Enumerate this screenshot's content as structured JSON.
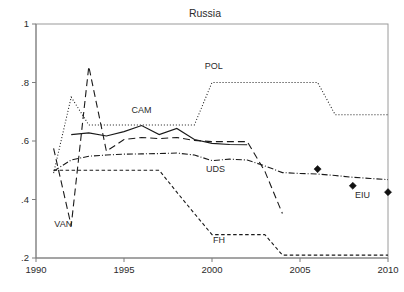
{
  "chart_data": {
    "type": "line",
    "title": "Russia",
    "xlabel": "",
    "ylabel": "",
    "xlim": [
      1990,
      2010
    ],
    "ylim": [
      0.2,
      1.0
    ],
    "grid": false,
    "legend": "inline-labels",
    "xticks": [
      1990,
      1995,
      2000,
      2005,
      2010
    ],
    "xtick_labels": [
      "1990",
      "1995",
      "2000",
      "2005",
      "2010"
    ],
    "yticks": [
      0.2,
      0.4,
      0.6,
      0.8,
      1.0
    ],
    "ytick_labels": [
      ".2",
      ".4",
      ".6",
      ".8",
      "1"
    ],
    "series": [
      {
        "name": "POL",
        "label": "POL",
        "style": "dotted",
        "label_x": 2000.1,
        "label_y": 0.845,
        "x": [
          1991,
          1992,
          1993,
          1994,
          1995,
          1996,
          1997,
          1998,
          1999,
          2000,
          2001,
          2002,
          2003,
          2004,
          2005,
          2006,
          2007,
          2008,
          2009,
          2010
        ],
        "y": [
          0.49,
          0.75,
          0.655,
          0.655,
          0.655,
          0.655,
          0.655,
          0.655,
          0.655,
          0.8,
          0.8,
          0.8,
          0.8,
          0.8,
          0.8,
          0.8,
          0.69,
          0.69,
          0.69,
          0.69
        ]
      },
      {
        "name": "CAM",
        "label": "CAM",
        "style": "solid",
        "label_x": 1996.0,
        "label_y": 0.695,
        "x": [
          1992,
          1993,
          1994,
          1995,
          1996,
          1997,
          1998,
          1999,
          2000,
          2001,
          2002
        ],
        "y": [
          0.622,
          0.628,
          0.617,
          0.632,
          0.653,
          0.622,
          0.643,
          0.605,
          0.592,
          0.588,
          0.587
        ]
      },
      {
        "name": "VAN",
        "label": "VAN",
        "style": "dashed-long",
        "label_x": 1991.55,
        "label_y": 0.305,
        "x": [
          1991,
          1992,
          1993,
          1994,
          1995,
          1996,
          1997,
          1998,
          1999,
          2000,
          2001,
          2002,
          2003,
          2004
        ],
        "y": [
          0.575,
          0.31,
          0.855,
          0.565,
          0.605,
          0.612,
          0.608,
          0.612,
          0.602,
          0.598,
          0.598,
          0.598,
          0.497,
          0.352
        ]
      },
      {
        "name": "UDS",
        "label": "UDS",
        "style": "dash-dot",
        "label_x": 2000.2,
        "label_y": 0.495,
        "x": [
          1991,
          1992,
          1993,
          1994,
          1995,
          1996,
          1997,
          1998,
          1999,
          2000,
          2001,
          2002,
          2003,
          2004,
          2005,
          2006,
          2007,
          2008,
          2009,
          2010
        ],
        "y": [
          0.497,
          0.535,
          0.548,
          0.552,
          0.555,
          0.556,
          0.557,
          0.559,
          0.552,
          0.533,
          0.538,
          0.535,
          0.515,
          0.492,
          0.489,
          0.487,
          0.482,
          0.476,
          0.472,
          0.468
        ]
      },
      {
        "name": "FH",
        "label": "FH",
        "style": "dashed-short",
        "label_x": 2000.4,
        "label_y": 0.252,
        "x": [
          1991,
          1992,
          1993,
          1994,
          1995,
          1996,
          1997,
          1998,
          1999,
          2000,
          2001,
          2002,
          2003,
          2004,
          2005,
          2006,
          2007,
          2008,
          2009,
          2010
        ],
        "y": [
          0.5,
          0.5,
          0.5,
          0.5,
          0.5,
          0.5,
          0.5,
          0.425,
          0.352,
          0.28,
          0.28,
          0.28,
          0.28,
          0.21,
          0.21,
          0.21,
          0.21,
          0.21,
          0.21,
          0.21
        ]
      }
    ],
    "markers": {
      "name": "EIU",
      "label": "EIU",
      "label_x": 2008.55,
      "label_y": 0.405,
      "shape": "diamond",
      "points": [
        {
          "x": 2006,
          "y": 0.504
        },
        {
          "x": 2008,
          "y": 0.447
        },
        {
          "x": 2010,
          "y": 0.425
        }
      ]
    }
  }
}
